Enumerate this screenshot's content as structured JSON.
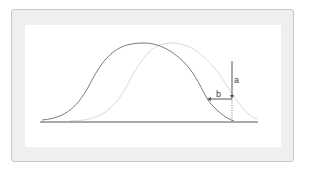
{
  "diagram": {
    "type": "two shifted bell curves with offset arrows",
    "curves": [
      {
        "name": "original-curve",
        "color": "#7a7a7a",
        "peak_x": 144
      },
      {
        "name": "shifted-curve",
        "color": "#d8d8d8",
        "peak_x": 172
      }
    ],
    "labels": {
      "a": "a",
      "b": "b"
    },
    "colors": {
      "frame_bg": "#efefef",
      "frame_border": "#c8c8c8",
      "canvas_bg": "#ffffff",
      "axis": "#555555",
      "arrow": "#555555"
    }
  }
}
